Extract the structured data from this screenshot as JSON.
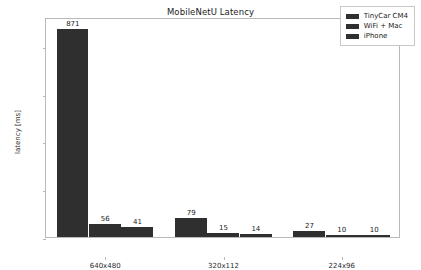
{
  "chart_data": {
    "type": "bar",
    "title": "MobileNetU Latency",
    "xlabel": "",
    "ylabel": "latency [ms]",
    "categories": [
      "640x480",
      "320x112",
      "224x96"
    ],
    "series": [
      {
        "name": "TinyCar CM4",
        "values": [
          871,
          79,
          27
        ],
        "color": "#2f2f2f"
      },
      {
        "name": "WiFi + Mac",
        "values": [
          56,
          15,
          10
        ],
        "color": "#2f2f2f"
      },
      {
        "name": "iPhone",
        "values": [
          41,
          14,
          10
        ],
        "color": "#2f2f2f"
      }
    ],
    "ylim": [
      0,
      920
    ],
    "yticks": [
      0,
      200,
      400,
      600,
      800
    ],
    "ytick_labels": [
      "0",
      "200",
      "400",
      "600",
      "800"
    ],
    "grid": false,
    "legend_position": "upper right",
    "bar_labels": true
  },
  "legend": {
    "entries": [
      {
        "label": "TinyCar CM4"
      },
      {
        "label": "WiFi + Mac"
      },
      {
        "label": "iPhone"
      }
    ]
  }
}
